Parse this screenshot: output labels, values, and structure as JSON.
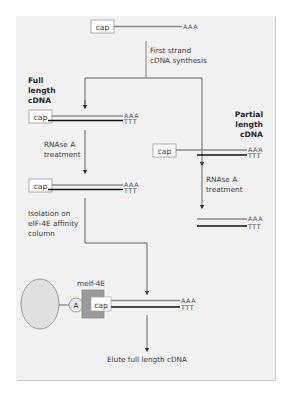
{
  "diagram": {
    "type": "flowchart",
    "title": "",
    "colors": {
      "background": "#f1f1f1",
      "rna_strand": "#8a8a8a",
      "cdna_strand": "#111111",
      "arrow": "#555555",
      "bead": "#e0e0e0",
      "meif4e_block": "#9a9a9a"
    },
    "top": {
      "cap_label": "cap",
      "polyA": "AAA",
      "step_line1": "First strand",
      "step_line2": "cDNA synthesis"
    },
    "full_length": {
      "heading_line1": "Full",
      "heading_line2": "length",
      "heading_line3": "cDNA",
      "cap_label": "cap",
      "polyA": "AAA",
      "polyT": "TTT",
      "step_line1": "RNAse A",
      "step_line2": "treatment",
      "after_cap_label": "cap",
      "after_polyA": "AAA",
      "after_polyT": "TTT",
      "isolation_line1": "Isolation on",
      "isolation_line2": "eIF-4E affinity",
      "isolation_line3": "column"
    },
    "partial_length": {
      "heading_line1": "Partial",
      "heading_line2": "length",
      "heading_line3": "cDNA",
      "cap_label": "cap",
      "polyA": "AAA",
      "polyT": "TTT",
      "step_line1": "RNAse A",
      "step_line2": "treatment",
      "after_polyA": "AAA",
      "after_polyT": "TTT"
    },
    "column": {
      "protein_label": "meIf-4E",
      "linker_label": "A",
      "cap_label": "cap",
      "polyA": "AAA",
      "polyT": "TTT"
    },
    "final_step": "Elute full length cDNA"
  }
}
